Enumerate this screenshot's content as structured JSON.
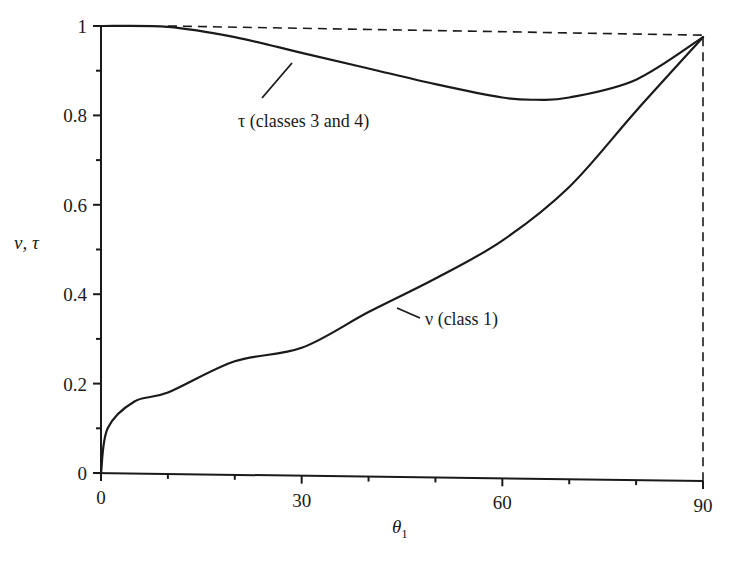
{
  "chart_data": {
    "type": "line",
    "title": "",
    "xlabel": "θ1",
    "ylabel": "ν, τ",
    "xlim": [
      0,
      90
    ],
    "ylim": [
      0,
      1
    ],
    "grid": false,
    "legend": "none (inline annotations)",
    "x_ticks": [
      0,
      30,
      60,
      90
    ],
    "x_tick_labels": [
      "0",
      "30",
      "60",
      "90"
    ],
    "x_minor_ticks": [
      10,
      20,
      40,
      50,
      70,
      80
    ],
    "y_ticks": [
      0,
      0.2,
      0.4,
      0.6,
      0.8,
      1
    ],
    "y_tick_labels": [
      "0",
      "0.2",
      "0.4",
      "0.6",
      "0.8",
      "1"
    ],
    "y_minor_ticks": [
      0.1,
      0.3,
      0.5,
      0.7,
      0.9
    ],
    "x": [
      0,
      1,
      5,
      10,
      20,
      30,
      40,
      50,
      60,
      70,
      80,
      90
    ],
    "series": [
      {
        "name": "τ (classes 3 and 4)",
        "x": [
          0,
          10,
          20,
          30,
          40,
          50,
          60,
          65,
          70,
          80,
          90
        ],
        "values": [
          1.0,
          0.998,
          0.975,
          0.94,
          0.905,
          0.87,
          0.84,
          0.835,
          0.84,
          0.88,
          0.975
        ]
      },
      {
        "name": "ν (class 1)",
        "x": [
          0,
          1,
          5,
          10,
          20,
          30,
          40,
          50,
          60,
          70,
          80,
          90
        ],
        "values": [
          0.0,
          0.1,
          0.16,
          0.18,
          0.25,
          0.28,
          0.36,
          0.435,
          0.52,
          0.64,
          0.81,
          0.975
        ]
      }
    ],
    "reference_lines": [
      {
        "type": "dashed",
        "description": "horizontal from (0,1) to (90,1)"
      },
      {
        "type": "dashed",
        "description": "vertical from (90,0) to (90,1)"
      }
    ],
    "annotations": [
      {
        "text": "τ (classes 3 and 4)",
        "points_to_series": "τ (classes 3 and 4)",
        "at_x": 27
      },
      {
        "text": "ν (class 1)",
        "points_to_series": "ν (class 1)",
        "at_x": 46
      }
    ]
  },
  "labels": {
    "y_axis": "ν, τ",
    "x_axis_main": "θ",
    "x_axis_sub": "1",
    "tau_annotation": "τ (classes 3 and 4)",
    "nu_annotation": "ν (class 1)"
  }
}
